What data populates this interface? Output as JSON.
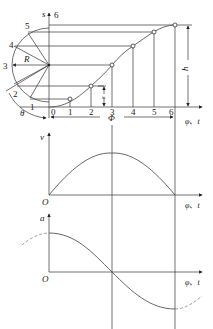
{
  "displacement": {
    "axis_y": "s",
    "axis_x": "φ、t",
    "radius_label": "R",
    "angle_label": "θ",
    "phase_label": "Φ",
    "height_label": "h",
    "s_label": "s",
    "circle_points": [
      "1",
      "2",
      "3",
      "4",
      "5",
      "6"
    ],
    "x_ticks": [
      "0",
      "1",
      "2",
      "3",
      "4",
      "5",
      "6"
    ]
  },
  "velocity": {
    "axis_y": "v",
    "axis_x": "φ、t",
    "origin": "O"
  },
  "acceleration": {
    "axis_y": "a",
    "axis_x": "φ、t",
    "origin": "O"
  },
  "colors": {
    "line": "#333333",
    "curve": "#555555"
  }
}
